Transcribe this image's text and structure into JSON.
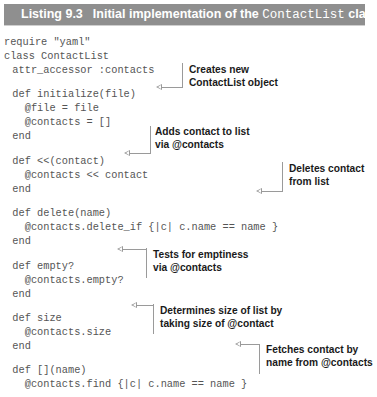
{
  "listing": {
    "number": "Listing 9.3",
    "title_prefix": "Initial implementation of the ",
    "title_code": "ContactList",
    "title_suffix": " class",
    "header_color": "#8f8f8f"
  },
  "code": [
    "require \"yaml\"",
    "class ContactList",
    "  attr_accessor :contacts",
    "",
    "  def initialize(file)",
    "    @file = file",
    "    @contacts = []",
    "  end",
    "",
    "  def <<(contact)",
    "    @contacts << contact",
    "  end",
    "",
    "  def delete(name)",
    "    @contacts.delete_if {|c| c.name == name }",
    "  end",
    "",
    "  def empty?",
    "    @contacts.empty?",
    "  end",
    "",
    "  def size",
    "    @contacts.size",
    "  end",
    "",
    "  def [](name)",
    "    @contacts.find {|c| c.name == name }",
    "  end",
    "end"
  ],
  "annotations": [
    {
      "id": "initialize",
      "text": "Creates new\nContactList object"
    },
    {
      "id": "append",
      "text": "Adds contact to list\nvia @contacts"
    },
    {
      "id": "delete",
      "text": "Deletes contact\nfrom list"
    },
    {
      "id": "empty",
      "text": "Tests for emptiness\nvia @contacts"
    },
    {
      "id": "size",
      "text": "Determines size of list by\ntaking size of @contact"
    },
    {
      "id": "find",
      "text": "Fetches contact by\nname from @contacts"
    }
  ]
}
